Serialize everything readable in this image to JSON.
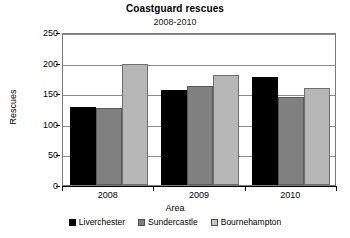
{
  "chart_data": {
    "type": "bar",
    "title": "Coastguard rescues",
    "subtitle": "2008-2010",
    "xlabel": "Area",
    "ylabel": "Rescues",
    "categories": [
      "2008",
      "2009",
      "2010"
    ],
    "series": [
      {
        "name": "Liverchester",
        "color": "#000000",
        "values": [
          128,
          155,
          176
        ]
      },
      {
        "name": "Sundercastle",
        "color": "#808080",
        "values": [
          126,
          161,
          144
        ]
      },
      {
        "name": "Bournehampton",
        "color": "#b7b7b7",
        "values": [
          197,
          180,
          158
        ]
      }
    ],
    "ylim": [
      0,
      250
    ],
    "yticks": [
      0,
      50,
      100,
      150,
      200,
      250
    ],
    "ytick_labels": [
      "0",
      "50",
      "100",
      "150",
      "200",
      "250"
    ],
    "grid": true,
    "legend_position": "bottom"
  }
}
